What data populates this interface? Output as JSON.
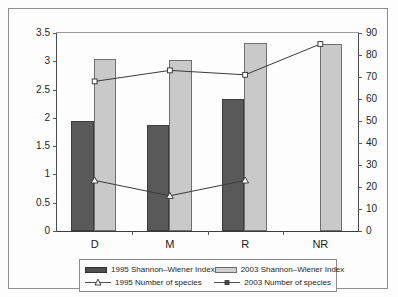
{
  "chart_data": {
    "type": "bar",
    "title": "",
    "xlabel": "",
    "ylabel": "",
    "grid": false,
    "legend_position": "bottom",
    "categories": [
      "D",
      "M",
      "R",
      "NR"
    ],
    "left_axis": {
      "label": "Shannon-Wiener Index",
      "ylim": [
        0,
        3.5
      ],
      "ticks": [
        "0",
        "0.5",
        "1",
        "1.5",
        "2",
        "2.5",
        "3",
        "3.5"
      ],
      "tick_values": [
        0,
        0.5,
        1,
        1.5,
        2,
        2.5,
        3,
        3.5
      ]
    },
    "right_axis": {
      "label": "Number of species",
      "ylim": [
        0,
        90
      ],
      "ticks": [
        "0",
        "10",
        "20",
        "30",
        "40",
        "50",
        "60",
        "70",
        "80",
        "90"
      ],
      "tick_values": [
        0,
        10,
        20,
        30,
        40,
        50,
        60,
        70,
        80,
        90
      ]
    },
    "series": [
      {
        "name": "1995 Shannon-Wiener Index",
        "type": "bar",
        "axis": "left",
        "color": "#595959",
        "values": [
          1.95,
          1.88,
          2.34,
          null
        ]
      },
      {
        "name": "2003 Shannon-Wiener Index",
        "type": "bar",
        "axis": "left",
        "color": "#c9c9c9",
        "values": [
          3.04,
          3.02,
          3.33,
          3.3
        ]
      },
      {
        "name": "1995 Number of species",
        "type": "line",
        "axis": "right",
        "marker": "triangle",
        "color": "#3a3a3a",
        "values": [
          23,
          16,
          23,
          null
        ]
      },
      {
        "name": "2003 Number of species",
        "type": "line",
        "axis": "right",
        "marker": "square",
        "color": "#3a3a3a",
        "values": [
          68,
          73,
          71,
          85
        ]
      }
    ]
  },
  "legend": {
    "items": [
      {
        "label": "1995 Shannon–Wiener Index",
        "symbol": "filled-dark-bar-swatch"
      },
      {
        "label": "2003 Shannon–Wiener Index",
        "symbol": "filled-light-bar-swatch"
      },
      {
        "label": "1995 Number of species",
        "symbol": "line-with-triangle-marker"
      },
      {
        "label": "2003 Number of species",
        "symbol": "line-with-square-marker"
      }
    ]
  }
}
